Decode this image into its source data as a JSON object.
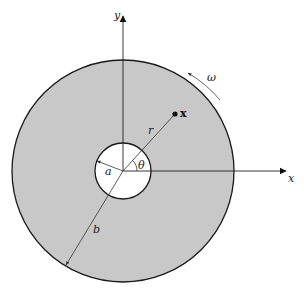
{
  "diagram": {
    "colors": {
      "annulus_fill": "#c8c8c8",
      "stroke": "#1a1a1a",
      "hole_fill": "#ffffff",
      "background": "#ffffff"
    },
    "geometry": {
      "center": [
        123,
        171
      ],
      "outer_radius": 111,
      "inner_radius": 28
    },
    "labels": {
      "y_axis": "y",
      "x_axis": "x",
      "omega": "ω",
      "point": "x",
      "r": "r",
      "theta": "θ",
      "a": "a",
      "b": "b"
    },
    "annotations": [
      {
        "symbol": "ω",
        "meaning": "angular velocity arrow (counter-clockwise)"
      },
      {
        "symbol": "x",
        "meaning": "point at radius r, angle θ"
      },
      {
        "symbol": "a",
        "meaning": "inner radius"
      },
      {
        "symbol": "b",
        "meaning": "outer radius"
      }
    ]
  }
}
